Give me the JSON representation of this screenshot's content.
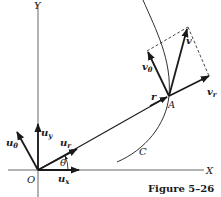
{
  "figure": {
    "caption": "Figure 5–26",
    "axes": {
      "x_label": "X",
      "y_label": "Y",
      "origin_label": "O"
    },
    "curve_label": "C",
    "point_label": "A",
    "angle_label": "θ",
    "position_vector_label": "r",
    "unit_vectors": {
      "u_x": {
        "base": "u",
        "sub": "x"
      },
      "u_y": {
        "base": "u",
        "sub": "y"
      },
      "u_r": {
        "base": "u",
        "sub": "r"
      },
      "u_theta": {
        "base": "u",
        "sub": "θ"
      }
    },
    "velocity_vectors": {
      "v": {
        "base": "v"
      },
      "v_r": {
        "base": "v",
        "sub": "r"
      },
      "v_theta": {
        "base": "v",
        "sub": "θ"
      }
    },
    "colors": {
      "ink": "#1a1a1a",
      "axis": "#555555"
    }
  }
}
